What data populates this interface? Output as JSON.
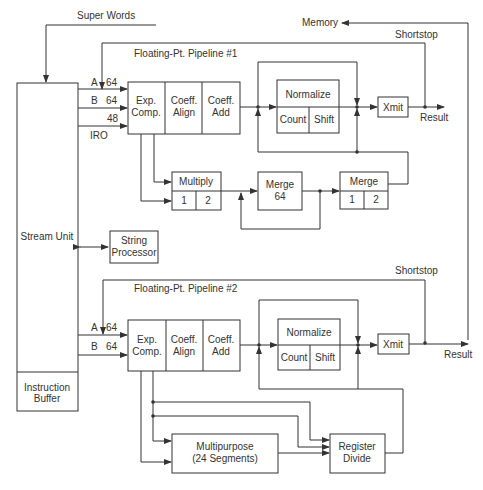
{
  "diagram": {
    "type": "block-diagram",
    "external_labels": {
      "super_words": "Super Words",
      "memory": "Memory",
      "shortstop_1": "Shortstop",
      "shortstop_2": "Shortstop",
      "result_1": "Result",
      "result_2": "Result"
    },
    "stream_unit": {
      "label": "Stream Unit"
    },
    "instruction_buffer": {
      "label_line1": "Instruction",
      "label_line2": "Buffer"
    },
    "string_processor": {
      "label_line1": "String",
      "label_line2": "Processor"
    },
    "pipeline_1": {
      "title": "Floating-Pt. Pipeline #1",
      "inputs": [
        {
          "name": "A",
          "width": "64"
        },
        {
          "name": "B",
          "width": "64"
        },
        {
          "name": "",
          "width": "48"
        },
        {
          "name": "IRO",
          "width": ""
        }
      ],
      "stages": [
        {
          "line1": "Exp.",
          "line2": "Comp."
        },
        {
          "line1": "Coeff.",
          "line2": "Align"
        },
        {
          "line1": "Coeff.",
          "line2": "Add"
        }
      ],
      "normalize": {
        "label": "Normalize",
        "sub": [
          "Count",
          "Shift"
        ]
      },
      "xmit": "Xmit",
      "multiply": {
        "label": "Multiply",
        "sub": [
          "1",
          "2"
        ]
      },
      "merge64": {
        "line1": "Merge",
        "line2": "64"
      },
      "merge": {
        "label": "Merge",
        "sub": [
          "1",
          "2"
        ]
      }
    },
    "pipeline_2": {
      "title": "Floating-Pt. Pipeline #2",
      "inputs": [
        {
          "name": "A",
          "width": "64"
        },
        {
          "name": "B",
          "width": "64"
        }
      ],
      "stages": [
        {
          "line1": "Exp.",
          "line2": "Comp."
        },
        {
          "line1": "Coeff.",
          "line2": "Align"
        },
        {
          "line1": "Coeff.",
          "line2": "Add"
        }
      ],
      "normalize": {
        "label": "Normalize",
        "sub": [
          "Count",
          "Shift"
        ]
      },
      "xmit": "Xmit",
      "multipurpose": {
        "line1": "Multipurpose",
        "line2": "(24 Segments)"
      },
      "register_divide": {
        "line1": "Register",
        "line2": "Divide"
      }
    }
  }
}
